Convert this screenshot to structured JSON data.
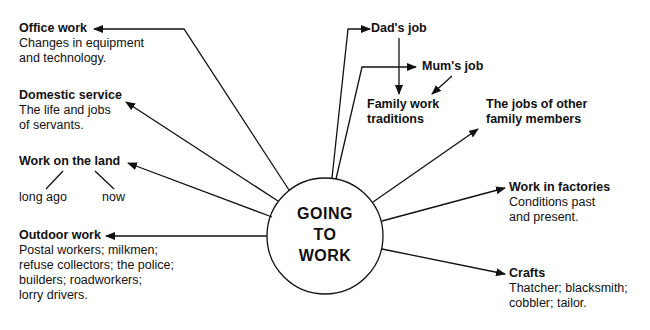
{
  "center": {
    "lines": [
      "GOING",
      "TO",
      "WORK"
    ]
  },
  "nodes": {
    "office_work": {
      "title": "Office work",
      "desc": [
        "Changes in equipment",
        "and technology."
      ]
    },
    "domestic_service": {
      "title": "Domestic service",
      "desc": [
        "The life and jobs",
        "of servants."
      ]
    },
    "work_on_land": {
      "title": "Work on the land",
      "sub": [
        "long ago",
        "now"
      ]
    },
    "outdoor_work": {
      "title": "Outdoor work",
      "desc": [
        "Postal workers; milkmen;",
        "refuse collectors; the police;",
        "builders; roadworkers;",
        "lorry drivers."
      ]
    },
    "dads_job": {
      "title": "Dad's job"
    },
    "mums_job": {
      "title": "Mum's job"
    },
    "family_traditions": {
      "title": [
        "Family work",
        "traditions"
      ]
    },
    "other_family": {
      "title": [
        "The jobs of other",
        "family members"
      ]
    },
    "factories": {
      "title": "Work in factories",
      "desc": [
        "Conditions past",
        "and present."
      ]
    },
    "crafts": {
      "title": "Crafts",
      "desc": [
        "Thatcher; blacksmith;",
        "cobbler; tailor."
      ]
    }
  },
  "colors": {
    "ink": "#111111",
    "background": "#ffffff"
  }
}
